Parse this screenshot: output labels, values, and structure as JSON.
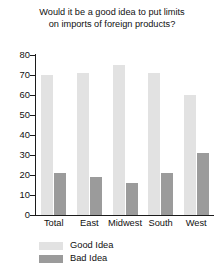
{
  "chart_data": {
    "type": "bar",
    "title": "Would it be a good idea to put limits on imports of foreign products?",
    "title_lines": [
      "Would it be a good idea to put limits",
      "on imports of foreign products?"
    ],
    "xlabel": "",
    "ylabel": "",
    "ylim": [
      0,
      80
    ],
    "yticks": [
      0,
      10,
      20,
      30,
      40,
      50,
      60,
      70,
      80
    ],
    "ytick_labels": [
      "0",
      "10",
      "20",
      "30",
      "40",
      "50",
      "60",
      "70",
      "80"
    ],
    "grid": false,
    "legend_position": "bottom-left",
    "categories": [
      "Total",
      "East",
      "Midwest",
      "South",
      "West"
    ],
    "series": [
      {
        "name": "Good Idea",
        "color": "#e2e2e2",
        "values": [
          70,
          71,
          75,
          71,
          60
        ]
      },
      {
        "name": "Bad Idea",
        "color": "#9b9b9b",
        "values": [
          21,
          19,
          16,
          21,
          31
        ]
      }
    ]
  },
  "legend": {
    "items": [
      {
        "label": "Good Idea",
        "color": "#e2e2e2"
      },
      {
        "label": "Bad Idea",
        "color": "#9b9b9b"
      }
    ]
  }
}
